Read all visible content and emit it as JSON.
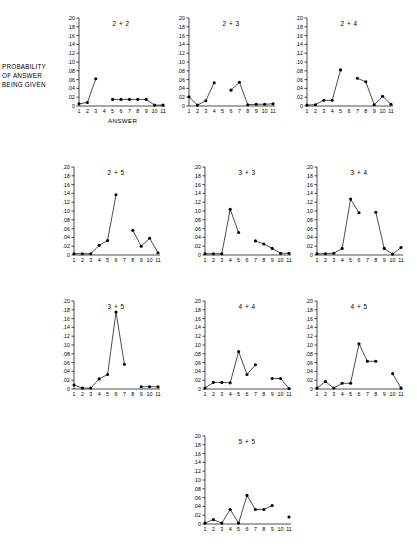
{
  "figure": {
    "axis_labels": {
      "y_caption_lines": [
        "PROBABILITY",
        "OF ANSWER",
        "BEING GIVEN"
      ],
      "x_caption": "ANSWER"
    },
    "y_ticks": [
      "0",
      ".02",
      ".04",
      ".06",
      ".08",
      ".10",
      ".12",
      ".14",
      ".16",
      ".18",
      ".20"
    ],
    "x_ticks": [
      "1",
      "2",
      "3",
      "4",
      "5",
      "6",
      "7",
      "8",
      "9",
      "10",
      "11"
    ],
    "ink_color": "#000000",
    "background_color": "#ffffff"
  },
  "chart_data": [
    {
      "type": "line",
      "title": "2 + 2",
      "xlabel": "ANSWER",
      "ylabel": "PROBABILITY OF ANSWER BEING GIVEN",
      "ylim": [
        0,
        0.2
      ],
      "xlim": [
        1,
        11
      ],
      "grid": false,
      "legend": false,
      "x": [
        1,
        2,
        3,
        5,
        6,
        7,
        8,
        9,
        10,
        11
      ],
      "values": [
        0.005,
        0.008,
        0.062,
        0.015,
        0.015,
        0.015,
        0.015,
        0.015,
        0.002,
        0.002
      ],
      "segments": [
        [
          1,
          2,
          3
        ],
        [
          5,
          6,
          7,
          8,
          9,
          10,
          11
        ]
      ]
    },
    {
      "type": "line",
      "title": "2 + 3",
      "ylim": [
        0,
        0.2
      ],
      "xlim": [
        1,
        11
      ],
      "grid": false,
      "legend": false,
      "x": [
        1,
        2,
        3,
        4,
        6,
        7,
        8,
        9,
        10,
        11
      ],
      "values": [
        0.021,
        0.002,
        0.012,
        0.053,
        0.036,
        0.054,
        0.003,
        0.004,
        0.004,
        0.005
      ],
      "segments": [
        [
          1,
          2,
          3,
          4
        ],
        [
          6,
          7,
          8,
          9,
          10,
          11
        ]
      ]
    },
    {
      "type": "line",
      "title": "2 + 4",
      "ylim": [
        0,
        0.2
      ],
      "xlim": [
        1,
        11
      ],
      "grid": false,
      "legend": false,
      "x": [
        1,
        2,
        3,
        4,
        5,
        7,
        8,
        9,
        10,
        11
      ],
      "values": [
        0.002,
        0.003,
        0.013,
        0.013,
        0.082,
        0.063,
        0.055,
        0.003,
        0.022,
        0.004
      ],
      "segments": [
        [
          1,
          2,
          3,
          4,
          5
        ],
        [
          7,
          8,
          9,
          10,
          11
        ]
      ]
    },
    {
      "type": "line",
      "title": "2 + 5",
      "ylim": [
        0,
        0.2
      ],
      "xlim": [
        1,
        11
      ],
      "grid": false,
      "legend": false,
      "x": [
        1,
        2,
        3,
        4,
        5,
        6,
        8,
        9,
        10,
        11
      ],
      "values": [
        0.003,
        0.003,
        0.003,
        0.022,
        0.033,
        0.137,
        0.056,
        0.02,
        0.038,
        0.005
      ],
      "segments": [
        [
          1,
          2,
          3,
          4,
          5,
          6
        ],
        [
          8,
          9,
          10,
          11
        ]
      ]
    },
    {
      "type": "line",
      "title": "3 + 3",
      "ylim": [
        0,
        0.2
      ],
      "xlim": [
        1,
        11
      ],
      "grid": false,
      "legend": false,
      "x": [
        1,
        2,
        3,
        4,
        5,
        7,
        8,
        9,
        10,
        11
      ],
      "values": [
        0.003,
        0.003,
        0.003,
        0.104,
        0.051,
        0.032,
        0.025,
        0.015,
        0.004,
        0.004
      ],
      "segments": [
        [
          1,
          2,
          3,
          4,
          5
        ],
        [
          7,
          8,
          9,
          10,
          11
        ]
      ]
    },
    {
      "type": "line",
      "title": "3 + 4",
      "ylim": [
        0,
        0.2
      ],
      "xlim": [
        1,
        11
      ],
      "grid": false,
      "legend": false,
      "x": [
        1,
        2,
        3,
        4,
        5,
        6,
        8,
        9,
        10,
        11
      ],
      "values": [
        0.003,
        0.003,
        0.004,
        0.015,
        0.127,
        0.096,
        0.097,
        0.015,
        0.002,
        0.017
      ],
      "segments": [
        [
          1,
          2,
          3,
          4,
          5,
          6
        ],
        [
          8,
          9,
          10,
          11
        ]
      ]
    },
    {
      "type": "line",
      "title": "3 + 5",
      "ylim": [
        0,
        0.2
      ],
      "xlim": [
        1,
        11
      ],
      "grid": false,
      "legend": false,
      "x": [
        1,
        2,
        3,
        4,
        5,
        6,
        7,
        9,
        10,
        11
      ],
      "values": [
        0.009,
        0.002,
        0.002,
        0.023,
        0.033,
        0.175,
        0.056,
        0.005,
        0.005,
        0.005
      ],
      "segments": [
        [
          1,
          2,
          3,
          4,
          5,
          6,
          7
        ],
        [
          9,
          10,
          11
        ]
      ]
    },
    {
      "type": "line",
      "title": "4 + 4",
      "ylim": [
        0,
        0.2
      ],
      "xlim": [
        1,
        11
      ],
      "grid": false,
      "legend": false,
      "x": [
        1,
        2,
        3,
        4,
        5,
        6,
        7,
        9,
        10,
        11
      ],
      "values": [
        0.002,
        0.015,
        0.015,
        0.014,
        0.085,
        0.033,
        0.055,
        0.024,
        0.024,
        0.001
      ],
      "segments": [
        [
          1,
          2,
          3,
          4,
          5,
          6,
          7
        ],
        [
          9,
          10,
          11
        ]
      ]
    },
    {
      "type": "line",
      "title": "4 + 5",
      "ylim": [
        0,
        0.2
      ],
      "xlim": [
        1,
        11
      ],
      "grid": false,
      "legend": false,
      "x": [
        1,
        2,
        3,
        4,
        5,
        6,
        7,
        8,
        10,
        11
      ],
      "values": [
        0.002,
        0.017,
        0.002,
        0.013,
        0.013,
        0.103,
        0.063,
        0.063,
        0.035,
        0.002
      ],
      "segments": [
        [
          1,
          2,
          3,
          4,
          5,
          6,
          7,
          8
        ],
        [
          10,
          11
        ]
      ]
    },
    {
      "type": "line",
      "title": "5 + 5",
      "ylim": [
        0,
        0.2
      ],
      "xlim": [
        1,
        11
      ],
      "grid": false,
      "legend": false,
      "x": [
        1,
        2,
        3,
        4,
        5,
        6,
        7,
        8,
        9,
        11
      ],
      "values": [
        0.002,
        0.01,
        0.002,
        0.033,
        0.002,
        0.065,
        0.033,
        0.033,
        0.042,
        0.016
      ],
      "segments": [
        [
          1,
          2,
          3,
          4,
          5,
          6,
          7,
          8,
          9
        ],
        [
          11
        ]
      ]
    }
  ],
  "panel_layout": [
    {
      "index": 0,
      "left": 62,
      "top": 14,
      "width": 105,
      "height": 112,
      "show_y_ticklabels": true,
      "show_x_caption": true
    },
    {
      "index": 1,
      "left": 172,
      "top": 14,
      "width": 105,
      "height": 112,
      "show_y_ticklabels": true,
      "show_x_caption": false
    },
    {
      "index": 2,
      "left": 290,
      "top": 14,
      "width": 105,
      "height": 112,
      "show_y_ticklabels": true,
      "show_x_caption": false
    },
    {
      "index": 3,
      "left": 57,
      "top": 163,
      "width": 105,
      "height": 112,
      "show_y_ticklabels": true,
      "show_x_caption": false
    },
    {
      "index": 4,
      "left": 188,
      "top": 163,
      "width": 105,
      "height": 112,
      "show_y_ticklabels": true,
      "show_x_caption": false
    },
    {
      "index": 5,
      "left": 300,
      "top": 163,
      "width": 105,
      "height": 112,
      "show_y_ticklabels": true,
      "show_x_caption": false
    },
    {
      "index": 6,
      "left": 57,
      "top": 297,
      "width": 105,
      "height": 112,
      "show_y_ticklabels": true,
      "show_x_caption": false
    },
    {
      "index": 7,
      "left": 188,
      "top": 297,
      "width": 105,
      "height": 112,
      "show_y_ticklabels": true,
      "show_x_caption": false
    },
    {
      "index": 8,
      "left": 300,
      "top": 297,
      "width": 105,
      "height": 112,
      "show_y_ticklabels": true,
      "show_x_caption": false
    },
    {
      "index": 9,
      "left": 188,
      "top": 432,
      "width": 105,
      "height": 112,
      "show_y_ticklabels": true,
      "show_x_caption": false
    }
  ]
}
